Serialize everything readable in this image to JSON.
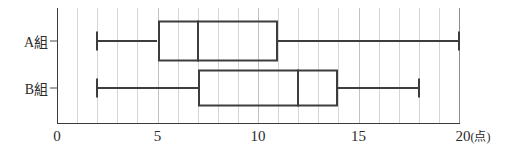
{
  "chart_data": {
    "type": "box",
    "title": "",
    "xlabel": "点",
    "ylabel": "",
    "orientation": "horizontal",
    "xlim": [
      0,
      20
    ],
    "grid": true,
    "minor_grid_step": 1,
    "legend": "none",
    "x_tick_labels": [
      "0",
      "5",
      "10",
      "15",
      "20"
    ],
    "x_tick_values": [
      0,
      5,
      10,
      15,
      20
    ],
    "x_unit_label": "(点)",
    "categories": [
      "A組",
      "B組"
    ],
    "boxes": [
      {
        "label": "A組",
        "min": 2,
        "q1": 5,
        "median": 7,
        "q3": 11,
        "max": 20
      },
      {
        "label": "B組",
        "min": 2,
        "q1": 7,
        "median": 12,
        "q3": 14,
        "max": 18
      }
    ],
    "colors": {
      "line": "#3d3d3d",
      "axis": "#3a3a3a",
      "grid": "#d6d6d6",
      "text": "#2b2b2b",
      "background": "#ffffff"
    }
  }
}
